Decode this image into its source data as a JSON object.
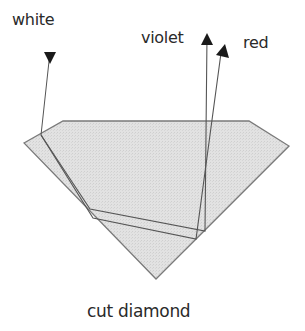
{
  "diagram": {
    "labels": {
      "white": "white",
      "violet": "violet",
      "red": "red",
      "caption": "cut diamond"
    },
    "colors": {
      "diamond_fill": "#dcdcdc",
      "diamond_stroke": "#808080",
      "ray_stroke": "#555555",
      "arrow_fill": "#1a1a1a",
      "text": "#2a2a2a"
    }
  }
}
